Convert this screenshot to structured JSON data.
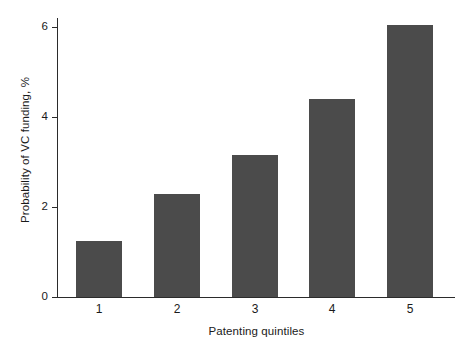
{
  "chart_data": {
    "type": "bar",
    "title": "",
    "subtitle": "",
    "xlabel": "Patenting quintiles",
    "ylabel": "Probability of VC funding, %",
    "categories": [
      "1",
      "2",
      "3",
      "4",
      "5"
    ],
    "values": [
      1.25,
      2.3,
      3.15,
      4.4,
      6.05
    ],
    "series": [
      {
        "name": "Probability of VC funding",
        "values": [
          1.25,
          2.3,
          3.15,
          4.4,
          6.05
        ]
      }
    ],
    "ylim": [
      0,
      6.2
    ],
    "yticks": [
      0,
      2,
      4,
      6
    ],
    "ytick_labels": [
      "0",
      "2",
      "4",
      "6"
    ],
    "xtick_labels": [
      "1",
      "2",
      "3",
      "4",
      "5"
    ],
    "grid": false,
    "legend": false,
    "legend_position": "none",
    "bar_color": "#4b4b4b",
    "axis_color": "#2b2b2b",
    "background_color": "#ffffff",
    "annotations": []
  }
}
